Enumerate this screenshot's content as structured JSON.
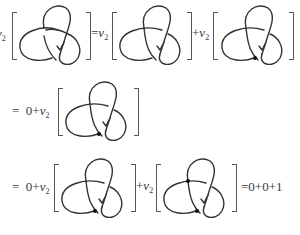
{
  "invariant": {
    "symbol": "v",
    "subscript": "2"
  },
  "rows": [
    {
      "terms": [
        {
          "prefix": "",
          "knot": "trefoil-oriented",
          "double_points": 0
        },
        {
          "prefix": "=",
          "knot": "trefoil-crossing-changed",
          "double_points": 0
        },
        {
          "prefix": "+",
          "knot": "trefoil-singular",
          "double_points": 1
        }
      ]
    },
    {
      "lead": "= 0+",
      "terms": [
        {
          "knot": "trefoil-singular",
          "double_points": 1
        }
      ]
    },
    {
      "lead": "= 0+",
      "terms": [
        {
          "knot": "trefoil-singular",
          "double_points": 1
        },
        {
          "prefix": "+",
          "knot": "trefoil-two-singular",
          "double_points": 2
        }
      ],
      "result": "=0+0+1"
    }
  ],
  "labels": {
    "v": "v",
    "sub": "2",
    "eq": "=",
    "plus": "+",
    "lead": "=  0+",
    "result": "=0+0+1"
  }
}
